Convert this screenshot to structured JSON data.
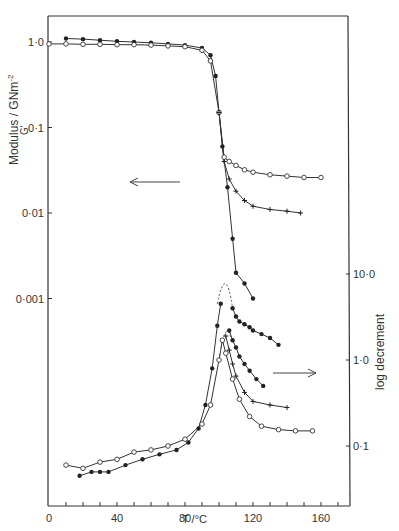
{
  "chart_data": {
    "type": "scatter",
    "title": "",
    "xlabel": "T /°C",
    "ylabel_left": "Modulus / GNm⁻²",
    "ylabel_left_sub": "G'",
    "ylabel_right": "log decrement",
    "xlim": [
      0,
      175
    ],
    "ylim_left": [
      0.0001,
      1.5
    ],
    "ylim_right": [
      0.04,
      15
    ],
    "x_ticks": [
      0,
      40,
      80,
      120,
      160
    ],
    "x_tick_labels": [
      "0",
      "40",
      "80",
      "120",
      "160"
    ],
    "y_left_ticks": [
      1.0,
      0.1,
      0.01,
      0.001
    ],
    "y_left_tick_labels": [
      "1·0",
      "0·1",
      "0·01",
      "0·001"
    ],
    "y_right_ticks": [
      10.0,
      1.0,
      0.1
    ],
    "y_right_tick_labels": [
      "10·0",
      "1·0",
      "0·1"
    ],
    "scale": "log",
    "grid": false,
    "annotations": [
      {
        "type": "arrow",
        "direction": "left",
        "meaning": "modulus curves use left axis"
      },
      {
        "type": "arrow",
        "direction": "right",
        "meaning": "log decrement curves use right axis"
      }
    ],
    "series": [
      {
        "name": "Modulus (filled)",
        "axis": "left",
        "marker": "filled-circle",
        "x": [
          10,
          20,
          30,
          40,
          50,
          60,
          70,
          80,
          90,
          95,
          98,
          100,
          102,
          105,
          108,
          110,
          115,
          120
        ],
        "y": [
          1.1,
          1.08,
          1.05,
          1.02,
          1.0,
          0.98,
          0.95,
          0.92,
          0.85,
          0.7,
          0.4,
          0.15,
          0.06,
          0.02,
          0.005,
          0.002,
          0.0015,
          0.001
        ]
      },
      {
        "name": "Modulus (open)",
        "axis": "left",
        "marker": "open-circle",
        "x": [
          0,
          10,
          20,
          30,
          40,
          50,
          60,
          70,
          80,
          90,
          95,
          100,
          103,
          106,
          110,
          115,
          120,
          130,
          140,
          150,
          160
        ],
        "y": [
          0.95,
          0.95,
          0.94,
          0.94,
          0.93,
          0.93,
          0.92,
          0.9,
          0.88,
          0.8,
          0.6,
          0.15,
          0.045,
          0.04,
          0.036,
          0.032,
          0.03,
          0.028,
          0.027,
          0.026,
          0.026
        ]
      },
      {
        "name": "Modulus (cross)",
        "axis": "left",
        "marker": "cross",
        "x": [
          100,
          103,
          106,
          110,
          115,
          120,
          130,
          140,
          148
        ],
        "y": [
          0.15,
          0.04,
          0.025,
          0.018,
          0.014,
          0.012,
          0.011,
          0.0105,
          0.01
        ]
      },
      {
        "name": "Log decrement (filled, upper)",
        "axis": "right",
        "marker": "filled-circle",
        "x": [
          108,
          110,
          112,
          115,
          118,
          120,
          125,
          130,
          135
        ],
        "y": [
          4.0,
          3.2,
          2.8,
          2.6,
          2.4,
          2.2,
          2.0,
          1.8,
          1.5
        ]
      },
      {
        "name": "Log decrement (filled, middle)",
        "axis": "right",
        "marker": "filled-circle",
        "x": [
          106,
          108,
          110,
          112,
          115,
          118,
          122,
          126
        ],
        "y": [
          2.2,
          1.7,
          1.4,
          1.1,
          0.9,
          0.75,
          0.6,
          0.5
        ]
      },
      {
        "name": "Log decrement (cross)",
        "axis": "right",
        "marker": "cross",
        "x": [
          104,
          106,
          108,
          110,
          115,
          120,
          130,
          140
        ],
        "y": [
          1.9,
          1.3,
          0.9,
          0.65,
          0.42,
          0.33,
          0.3,
          0.28
        ]
      },
      {
        "name": "Log decrement (open)",
        "axis": "right",
        "marker": "open-circle",
        "x": [
          10,
          20,
          30,
          40,
          50,
          60,
          70,
          80,
          90,
          95,
          100,
          102,
          104,
          108,
          112,
          118,
          125,
          135,
          145,
          155
        ],
        "y": [
          0.06,
          0.055,
          0.065,
          0.07,
          0.085,
          0.09,
          0.1,
          0.12,
          0.18,
          0.3,
          1.0,
          1.7,
          1.2,
          0.6,
          0.35,
          0.22,
          0.17,
          0.155,
          0.15,
          0.15
        ]
      },
      {
        "name": "Log decrement (rising, combined)",
        "axis": "right",
        "marker": "filled-circle",
        "x": [
          18,
          25,
          30,
          35,
          45,
          55,
          65,
          75,
          82,
          88,
          92,
          96,
          99,
          101
        ],
        "y": [
          0.045,
          0.05,
          0.05,
          0.05,
          0.06,
          0.07,
          0.08,
          0.09,
          0.11,
          0.16,
          0.3,
          0.8,
          2.5,
          4.5
        ]
      }
    ]
  },
  "labels": {
    "x_axis_title": "T /°C",
    "y_left_title": "Modulus / GNm",
    "y_left_title_sup": "-2",
    "y_left_sub": "G'",
    "y_right_title": "log  decrement"
  }
}
